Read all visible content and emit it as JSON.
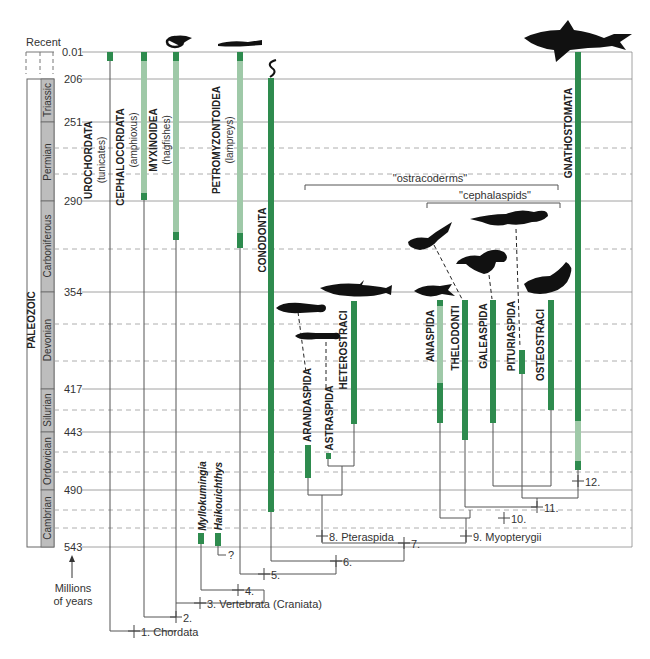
{
  "colors": {
    "range_dark": "#2e8b4e",
    "range_light": "#9fc9a8",
    "grid": "#888888",
    "period_box": "#bdbdbd",
    "silhouette": "#111111"
  },
  "axis": {
    "unit_label_line1": "Millions",
    "unit_label_line2": "of years",
    "era_label": "PALEOZOIC",
    "recent_label": "Recent",
    "ticks": [
      {
        "label": "0.01",
        "y": 52
      },
      {
        "label": "206",
        "y": 79
      },
      {
        "label": "251",
        "y": 122
      },
      {
        "label": "290",
        "y": 201
      },
      {
        "label": "354",
        "y": 292
      },
      {
        "label": "417",
        "y": 389
      },
      {
        "label": "443",
        "y": 432
      },
      {
        "label": "490",
        "y": 490
      },
      {
        "label": "543",
        "y": 547
      }
    ],
    "dashed_y": [
      148,
      174,
      249,
      324,
      361,
      410,
      452,
      472,
      510,
      528
    ],
    "periods": [
      {
        "name": "Triassic",
        "y1": 79,
        "y2": 122
      },
      {
        "name": "Permian",
        "y1": 122,
        "y2": 201
      },
      {
        "name": "Carboniferous",
        "y1": 201,
        "y2": 292
      },
      {
        "name": "Devonian",
        "y1": 292,
        "y2": 389
      },
      {
        "name": "Silurian",
        "y1": 389,
        "y2": 432
      },
      {
        "name": "Ordovician",
        "y1": 432,
        "y2": 490
      },
      {
        "name": "Cambrian",
        "y1": 490,
        "y2": 547
      }
    ]
  },
  "taxa": [
    {
      "name": "UROCHORDATA",
      "sub": "(tunicates)"
    },
    {
      "name": "CEPHALOCORDATA",
      "sub": "(amphioxus)"
    },
    {
      "name": "MYXINOIDEA",
      "sub": "(hagfishes)"
    },
    {
      "name": "PETROMYZONTOIDEA",
      "sub": "(lampreys)"
    },
    {
      "name": "CONODONTA",
      "sub": ""
    },
    {
      "name": "Myllokumingia",
      "sub": ""
    },
    {
      "name": "Haikouichthys",
      "sub": ""
    },
    {
      "name": "ARANDASPIDA",
      "sub": ""
    },
    {
      "name": "ASTRASPIDA",
      "sub": ""
    },
    {
      "name": "HETEROSTRACI",
      "sub": ""
    },
    {
      "name": "ANASPIDA",
      "sub": ""
    },
    {
      "name": "THELODONTI",
      "sub": ""
    },
    {
      "name": "GALEASPIDA",
      "sub": ""
    },
    {
      "name": "PITURIASPIDA",
      "sub": ""
    },
    {
      "name": "OSTEOSTRACI",
      "sub": ""
    },
    {
      "name": "GNATHOSTOMATA",
      "sub": ""
    }
  ],
  "groups": {
    "ostracoderms": "\"ostracoderms\"",
    "cephalaspids": "\"cephalaspids\""
  },
  "nodes": [
    "1. Chordata",
    "2.",
    "3. Vertebrata (Craniata)",
    "4.",
    "5.",
    "6.",
    "7.",
    "8. Pteraspida",
    "9. Myopterygii",
    "10.",
    "11.",
    "12.",
    "?"
  ]
}
